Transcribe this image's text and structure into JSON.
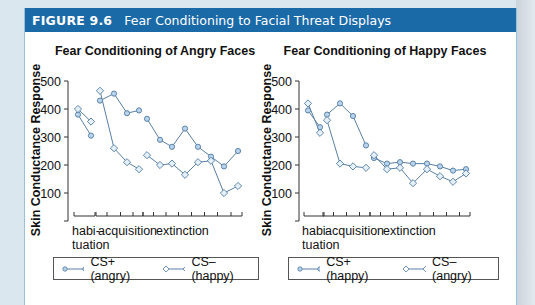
{
  "figure": {
    "number": "FIGURE 9.6",
    "title": "Fear Conditioning to Facial Threat Displays"
  },
  "colors": {
    "header_bg": "#1b6aa8",
    "line": "#5a7fa3",
    "marker_fill": "#b9d3ea",
    "marker_stroke": "#4f7ba3"
  },
  "chart_data": [
    {
      "type": "line",
      "title": "Fear Conditioning of Angry Faces",
      "ylabel": "Skin Conductance Response",
      "xlabel": "",
      "ylim": [
        0,
        500
      ],
      "yticks": [
        100,
        200,
        300,
        400,
        500
      ],
      "phases": [
        {
          "label": "habi-\ntuation",
          "n": 2
        },
        {
          "label": "acquisition",
          "n": 4
        },
        {
          "label": "extinction",
          "n": 8
        }
      ],
      "grid": false,
      "legend_position": "bottom",
      "series": [
        {
          "name": "CS+ (angry)",
          "marker": "circle",
          "habituation": [
            380,
            305
          ],
          "acquisition": [
            430,
            455,
            385,
            395
          ],
          "extinction": [
            365,
            290,
            265,
            330,
            265,
            230,
            195,
            250
          ]
        },
        {
          "name": "CS– (happy)",
          "marker": "diamond",
          "habituation": [
            400,
            355
          ],
          "acquisition": [
            465,
            260,
            210,
            185
          ],
          "extinction": [
            235,
            200,
            205,
            165,
            210,
            215,
            100,
            125
          ]
        }
      ]
    },
    {
      "type": "line",
      "title": "Fear Conditioning of Happy Faces",
      "ylabel": "Skin Conductance Response",
      "xlabel": "",
      "ylim": [
        0,
        500
      ],
      "yticks": [
        100,
        200,
        300,
        400,
        500
      ],
      "phases": [
        {
          "label": "habi-\ntuation",
          "n": 2
        },
        {
          "label": "acquisition",
          "n": 4
        },
        {
          "label": "extinction",
          "n": 8
        }
      ],
      "grid": false,
      "legend_position": "bottom",
      "series": [
        {
          "name": "CS+ (happy)",
          "marker": "circle",
          "habituation": [
            395,
            335
          ],
          "acquisition": [
            380,
            420,
            375,
            270
          ],
          "extinction": [
            225,
            205,
            210,
            205,
            205,
            195,
            180,
            185
          ]
        },
        {
          "name": "CS– (angry)",
          "marker": "diamond",
          "habituation": [
            420,
            315
          ],
          "acquisition": [
            360,
            205,
            195,
            190
          ],
          "extinction": [
            235,
            185,
            190,
            135,
            185,
            160,
            140,
            170
          ]
        }
      ]
    }
  ],
  "labels": {
    "habi": "habi-",
    "tuation": "tuation",
    "acquisition": "acquisition",
    "extinction": "extinction"
  }
}
